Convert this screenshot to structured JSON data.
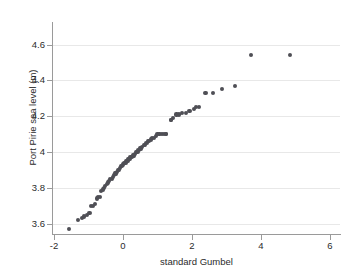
{
  "figure": {
    "background_color": "#ffffff",
    "marker_color": "#4f4f55",
    "gridline_color": "#e8e8e8",
    "axis_color": "#9a9a9a"
  },
  "chart_data": {
    "type": "scatter",
    "title": "",
    "subtitle": "",
    "xlabel": "standard Gumbel",
    "ylabel": "Port Pirie sea level (m)",
    "xlim": [
      -2.5,
      6.3
    ],
    "ylim": [
      3.52,
      4.75
    ],
    "xticks": [
      -2,
      0,
      2,
      4,
      6
    ],
    "xtick_labels": [
      "-2",
      "0",
      "2",
      "4",
      "6"
    ],
    "yticks": [
      3.6,
      3.8,
      4.0,
      4.2,
      4.4,
      4.6
    ],
    "ytick_labels": [
      "3.6",
      "3.8",
      "4",
      "4.2",
      "4.4",
      "4.6"
    ],
    "grid": "horizontal",
    "legend": "none",
    "annotations": [],
    "series": [
      {
        "name": "Port Pirie annual maximum sea level",
        "marker": "filled-circle",
        "color": "#4f4f55",
        "x": [
          -1.56,
          -1.31,
          -1.19,
          -1.12,
          -1.04,
          -0.97,
          -0.92,
          -0.86,
          -0.81,
          -0.76,
          -0.72,
          -0.67,
          -0.63,
          -0.59,
          -0.55,
          -0.51,
          -0.47,
          -0.44,
          -0.4,
          -0.37,
          -0.33,
          -0.3,
          -0.26,
          -0.23,
          -0.2,
          -0.17,
          -0.14,
          -0.11,
          -0.08,
          -0.05,
          -0.02,
          0.01,
          0.04,
          0.07,
          0.1,
          0.13,
          0.16,
          0.19,
          0.22,
          0.25,
          0.28,
          0.32,
          0.35,
          0.38,
          0.42,
          0.45,
          0.49,
          0.52,
          0.56,
          0.6,
          0.64,
          0.68,
          0.72,
          0.76,
          0.81,
          0.85,
          0.9,
          0.95,
          1.0,
          1.06,
          1.12,
          1.18,
          1.24,
          1.25,
          1.38,
          1.4,
          1.46,
          1.55,
          1.63,
          1.72,
          1.82,
          1.93,
          2.06,
          2.12,
          2.21,
          2.39,
          2.62,
          2.88,
          3.25,
          3.72,
          4.85
        ],
        "y": [
          3.57,
          3.62,
          3.63,
          3.64,
          3.65,
          3.66,
          3.7,
          3.7,
          3.71,
          3.74,
          3.75,
          3.75,
          3.78,
          3.79,
          3.8,
          3.81,
          3.82,
          3.83,
          3.84,
          3.85,
          3.85,
          3.86,
          3.87,
          3.88,
          3.88,
          3.89,
          3.9,
          3.9,
          3.91,
          3.92,
          3.92,
          3.93,
          3.94,
          3.94,
          3.95,
          3.95,
          3.96,
          3.96,
          3.97,
          3.97,
          3.98,
          3.98,
          3.99,
          4.0,
          4.0,
          4.01,
          4.02,
          4.02,
          4.03,
          4.04,
          4.04,
          4.05,
          4.06,
          4.06,
          4.07,
          4.08,
          4.08,
          4.09,
          4.1,
          4.1,
          4.1,
          4.1,
          4.1,
          4.1,
          4.18,
          4.18,
          4.19,
          4.21,
          4.21,
          4.22,
          4.22,
          4.23,
          4.24,
          4.25,
          4.25,
          4.33,
          4.33,
          4.35,
          4.37,
          4.54,
          4.54
        ],
        "n_points": 81
      }
    ]
  }
}
